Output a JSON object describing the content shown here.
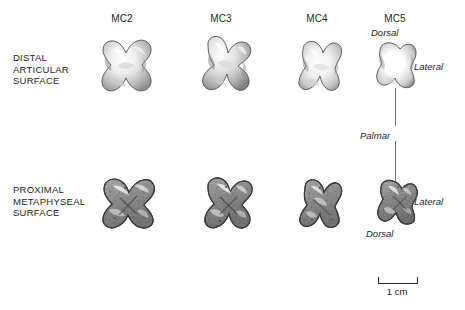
{
  "figure": {
    "background_color": "#ffffff",
    "text_color": "#232323",
    "line_color": "#6d6d6d"
  },
  "columns": [
    {
      "id": "mc2",
      "label": "MC2",
      "x": 92,
      "width": 60
    },
    {
      "id": "mc3",
      "label": "MC3",
      "x": 191,
      "width": 60
    },
    {
      "id": "mc4",
      "label": "MC4",
      "x": 287,
      "width": 60
    },
    {
      "id": "mc5",
      "label": "MC5",
      "x": 365,
      "width": 60
    }
  ],
  "rows": [
    {
      "id": "distal",
      "label": "DISTAL\nARTICULAR\nSURFACE",
      "line1": "DISTAL",
      "line2": "ARTICULAR",
      "line3": "SURFACE"
    },
    {
      "id": "proximal",
      "label": "PROXIMAL\nMETAPHYSEAL\nSURFACE",
      "line1": "PROXIMAL",
      "line2": "METAPHYSEAL",
      "line3": "SURFACE"
    }
  ],
  "orientation_labels": {
    "distal_top": "Dorsal",
    "distal_right": "Lateral",
    "middle": "Palmar",
    "proximal_right": "Lateral",
    "proximal_bottom": "Dorsal"
  },
  "scale": {
    "caption": "1 cm",
    "bar_length_px": 40
  },
  "specimens": [
    {
      "id": "mc2-distal",
      "bone": "MC2",
      "surface": "distal articular",
      "texture": "smooth-glossy"
    },
    {
      "id": "mc3-distal",
      "bone": "MC3",
      "surface": "distal articular",
      "texture": "smooth-glossy"
    },
    {
      "id": "mc4-distal",
      "bone": "MC4",
      "surface": "distal articular",
      "texture": "smooth-glossy"
    },
    {
      "id": "mc5-distal",
      "bone": "MC5",
      "surface": "distal articular",
      "texture": "smooth-glossy"
    },
    {
      "id": "mc2-proximal",
      "bone": "MC2",
      "surface": "proximal metaphyseal",
      "texture": "mottled-trabecular"
    },
    {
      "id": "mc3-proximal",
      "bone": "MC3",
      "surface": "proximal metaphyseal",
      "texture": "mottled-trabecular"
    },
    {
      "id": "mc4-proximal",
      "bone": "MC4",
      "surface": "proximal metaphyseal",
      "texture": "mottled-trabecular"
    },
    {
      "id": "mc5-proximal",
      "bone": "MC5",
      "surface": "proximal metaphyseal",
      "texture": "mottled-trabecular"
    }
  ]
}
